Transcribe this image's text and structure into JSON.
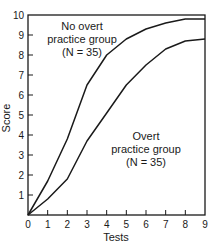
{
  "chart_data": {
    "type": "line",
    "title": "",
    "xlabel": "Tests",
    "ylabel": "Score",
    "x": [
      0,
      1,
      2,
      3,
      4,
      5,
      6,
      7,
      8,
      9
    ],
    "series": [
      {
        "name": "No overt practice group (N = 35)",
        "label_lines": [
          "No overt",
          "practice group",
          "(N = 35)"
        ],
        "values": [
          0,
          1.7,
          3.8,
          6.5,
          8.0,
          8.8,
          9.3,
          9.6,
          9.8,
          9.8
        ]
      },
      {
        "name": "Overt practice group (N = 35)",
        "label_lines": [
          "Overt",
          "practice group",
          "(N = 35)"
        ],
        "values": [
          0,
          0.8,
          1.8,
          3.7,
          5.1,
          6.5,
          7.5,
          8.3,
          8.7,
          8.8
        ]
      }
    ],
    "xticks": [
      "0",
      "1",
      "2",
      "3",
      "4",
      "5",
      "6",
      "7",
      "8",
      "9"
    ],
    "yticks": [
      "1",
      "2",
      "3",
      "4",
      "5",
      "6",
      "7",
      "8",
      "9",
      "10"
    ],
    "xlim": [
      0,
      9
    ],
    "ylim": [
      0,
      10
    ],
    "grid": false,
    "legend": "inline annotations"
  }
}
